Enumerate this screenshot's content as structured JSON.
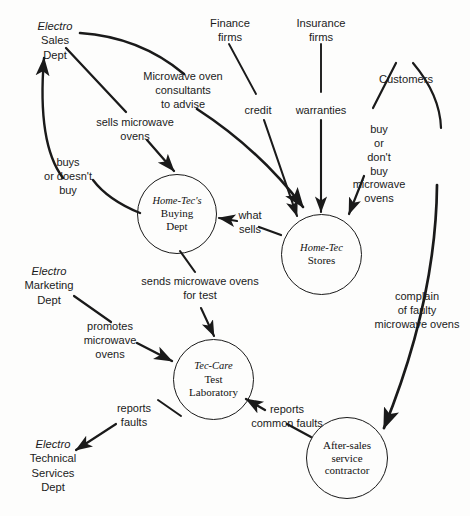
{
  "diagram": {
    "background_color": "#fdfdfc",
    "line_color": "#1a1a1a",
    "processes": [
      {
        "id": "buying-dept",
        "italic_line": "Home-Tec's",
        "lines": [
          "Buying",
          "Dept"
        ]
      },
      {
        "id": "home-tec-stores",
        "italic_line": "Home-Tec",
        "lines": [
          "Stores"
        ]
      },
      {
        "id": "tec-care-lab",
        "italic_line": "Tec-Care",
        "lines": [
          "Test",
          "Laboratory"
        ]
      },
      {
        "id": "after-sales-contractor",
        "italic_line": "",
        "lines": [
          "After-sales",
          "service",
          "contractor"
        ]
      }
    ],
    "entities": [
      {
        "id": "electro-sales-dept",
        "italic_line": "Electro",
        "lines": [
          "Sales",
          "Dept"
        ]
      },
      {
        "id": "finance-firms",
        "italic_line": "",
        "lines": [
          "Finance",
          "firms"
        ]
      },
      {
        "id": "insurance-firms",
        "italic_line": "",
        "lines": [
          "Insurance",
          "firms"
        ]
      },
      {
        "id": "customers",
        "italic_line": "",
        "lines": [
          "Customers"
        ]
      },
      {
        "id": "electro-marketing-dept",
        "italic_line": "Electro",
        "lines": [
          "Marketing",
          "Dept"
        ]
      },
      {
        "id": "electro-technical-services-dept",
        "italic_line": "Electro",
        "lines": [
          "Technical",
          "Services",
          "Dept"
        ]
      }
    ],
    "flows": [
      {
        "id": "microwave-oven-consultants",
        "lines": [
          "Microwave oven",
          "consultants",
          "to advise"
        ],
        "from": "electro-sales-dept",
        "to": "home-tec-stores"
      },
      {
        "id": "sells-microwave-ovens",
        "lines": [
          "sells microwave",
          "ovens"
        ],
        "from": "electro-sales-dept",
        "to": "buying-dept"
      },
      {
        "id": "buys-or-doesnt-buy",
        "lines": [
          "buys",
          "or doesn't",
          "buy"
        ],
        "from": "buying-dept",
        "to": "electro-sales-dept"
      },
      {
        "id": "credit",
        "lines": [
          "credit"
        ],
        "from": "finance-firms",
        "to": "home-tec-stores"
      },
      {
        "id": "warranties",
        "lines": [
          "warranties"
        ],
        "from": "insurance-firms",
        "to": "home-tec-stores"
      },
      {
        "id": "buy-or-dont-buy-microwave-ovens",
        "lines": [
          "buy",
          "or",
          "don't",
          "buy",
          "microwave",
          "ovens"
        ],
        "from": "customers",
        "to": "home-tec-stores"
      },
      {
        "id": "what-sells",
        "lines": [
          "what",
          "sells"
        ],
        "from": "home-tec-stores",
        "to": "buying-dept"
      },
      {
        "id": "sends-microwave-ovens-for-test",
        "lines": [
          "sends microwave ovens",
          "for test"
        ],
        "from": "buying-dept",
        "to": "tec-care-lab"
      },
      {
        "id": "promotes-microwave-ovens",
        "lines": [
          "promotes",
          "microwave",
          "ovens"
        ],
        "from": "electro-marketing-dept",
        "to": "tec-care-lab"
      },
      {
        "id": "complain-of-faulty-microwave-ovens",
        "lines": [
          "complain",
          "of faulty",
          "microwave ovens"
        ],
        "from": "customers",
        "to": "after-sales-contractor"
      },
      {
        "id": "reports-common-faults",
        "lines": [
          "reports",
          "common faults"
        ],
        "from": "after-sales-contractor",
        "to": "tec-care-lab"
      },
      {
        "id": "reports-faults",
        "lines": [
          "reports",
          "faults"
        ],
        "from": "tec-care-lab",
        "to": "electro-technical-services-dept"
      }
    ]
  }
}
